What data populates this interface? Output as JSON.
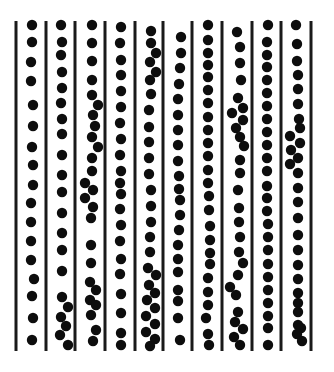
{
  "figure": {
    "colors": {
      "background": "#ffffff",
      "line": "#1a1a1a",
      "dot": "#0d0d0d"
    },
    "line_top": 21,
    "line_bottom": 351,
    "line_width": 3,
    "dot_radius": 5.2,
    "lines_x": [
      16,
      46,
      75,
      105,
      135,
      163,
      192,
      222,
      252,
      281,
      311
    ],
    "channels": [
      {
        "id": 1,
        "dots": [
          [
            32,
            25
          ],
          [
            32,
            42
          ],
          [
            31,
            62
          ],
          [
            31,
            81
          ],
          [
            33,
            105
          ],
          [
            33,
            126
          ],
          [
            32,
            147
          ],
          [
            33,
            165
          ],
          [
            33,
            185
          ],
          [
            31,
            203
          ],
          [
            31,
            222
          ],
          [
            31,
            241
          ],
          [
            31,
            260
          ],
          [
            34,
            279
          ],
          [
            32,
            296
          ],
          [
            33,
            318
          ],
          [
            32,
            340
          ]
        ]
      },
      {
        "id": 2,
        "dots": [
          [
            61,
            25
          ],
          [
            62,
            42
          ],
          [
            61,
            55
          ],
          [
            62,
            72
          ],
          [
            62,
            88
          ],
          [
            61,
            103
          ],
          [
            62,
            119
          ],
          [
            62,
            134
          ],
          [
            62,
            155
          ],
          [
            62,
            175
          ],
          [
            62,
            192
          ],
          [
            62,
            213
          ],
          [
            62,
            233
          ],
          [
            62,
            250
          ],
          [
            62,
            271
          ],
          [
            62,
            297
          ],
          [
            68,
            307
          ],
          [
            61,
            317
          ],
          [
            66,
            326
          ],
          [
            60,
            335
          ],
          [
            68,
            345
          ]
        ]
      },
      {
        "id": 3,
        "dots": [
          [
            92,
            25
          ],
          [
            92,
            43
          ],
          [
            92,
            61
          ],
          [
            92,
            80
          ],
          [
            92,
            95
          ],
          [
            98,
            105
          ],
          [
            93,
            115
          ],
          [
            95,
            126
          ],
          [
            92,
            137
          ],
          [
            98,
            147
          ],
          [
            92,
            158
          ],
          [
            92,
            171
          ],
          [
            85,
            183
          ],
          [
            93,
            190
          ],
          [
            85,
            198
          ],
          [
            93,
            207
          ],
          [
            91,
            218
          ],
          [
            91,
            245
          ],
          [
            91,
            263
          ],
          [
            90,
            282
          ],
          [
            96,
            290
          ],
          [
            90,
            300
          ],
          [
            96,
            305
          ],
          [
            91,
            315
          ],
          [
            96,
            330
          ],
          [
            93,
            341
          ]
        ]
      },
      {
        "id": 4,
        "dots": [
          [
            121,
            27
          ],
          [
            120,
            43
          ],
          [
            121,
            60
          ],
          [
            121,
            75
          ],
          [
            121,
            91
          ],
          [
            121,
            107
          ],
          [
            120,
            123
          ],
          [
            121,
            139
          ],
          [
            120,
            155
          ],
          [
            121,
            171
          ],
          [
            120,
            183
          ],
          [
            121,
            194
          ],
          [
            120,
            209
          ],
          [
            121,
            225
          ],
          [
            120,
            241
          ],
          [
            121,
            259
          ],
          [
            120,
            274
          ],
          [
            121,
            294
          ],
          [
            121,
            313
          ],
          [
            121,
            333
          ],
          [
            121,
            345
          ]
        ]
      },
      {
        "id": 5,
        "dots": [
          [
            151,
            31
          ],
          [
            151,
            43
          ],
          [
            156,
            53
          ],
          [
            150,
            62
          ],
          [
            156,
            72
          ],
          [
            150,
            80
          ],
          [
            151,
            94
          ],
          [
            149,
            110
          ],
          [
            149,
            127
          ],
          [
            149,
            142
          ],
          [
            149,
            158
          ],
          [
            149,
            174
          ],
          [
            151,
            190
          ],
          [
            151,
            206
          ],
          [
            151,
            222
          ],
          [
            150,
            237
          ],
          [
            150,
            252
          ],
          [
            148,
            268
          ],
          [
            156,
            275
          ],
          [
            149,
            285
          ],
          [
            155,
            293
          ],
          [
            147,
            300
          ],
          [
            155,
            308
          ],
          [
            146,
            316
          ],
          [
            155,
            324
          ],
          [
            146,
            332
          ],
          [
            155,
            339
          ],
          [
            150,
            346
          ]
        ]
      },
      {
        "id": 6,
        "dots": [
          [
            181,
            37
          ],
          [
            181,
            53
          ],
          [
            180,
            68
          ],
          [
            179,
            84
          ],
          [
            178,
            99
          ],
          [
            178,
            115
          ],
          [
            178,
            130
          ],
          [
            178,
            145
          ],
          [
            178,
            161
          ],
          [
            179,
            176
          ],
          [
            179,
            189
          ],
          [
            180,
            200
          ],
          [
            180,
            215
          ],
          [
            179,
            230
          ],
          [
            178,
            245
          ],
          [
            178,
            259
          ],
          [
            178,
            272
          ],
          [
            178,
            290
          ],
          [
            178,
            301
          ],
          [
            178,
            318
          ],
          [
            180,
            340
          ]
        ]
      },
      {
        "id": 7,
        "dots": [
          [
            208,
            25
          ],
          [
            208,
            40
          ],
          [
            208,
            53
          ],
          [
            208,
            65
          ],
          [
            208,
            77
          ],
          [
            208,
            90
          ],
          [
            208,
            103
          ],
          [
            208,
            117
          ],
          [
            208,
            130
          ],
          [
            208,
            143
          ],
          [
            208,
            156
          ],
          [
            208,
            170
          ],
          [
            208,
            183
          ],
          [
            209,
            196
          ],
          [
            209,
            210
          ],
          [
            210,
            226
          ],
          [
            210,
            240
          ],
          [
            210,
            253
          ],
          [
            210,
            264
          ],
          [
            208,
            278
          ],
          [
            208,
            292
          ],
          [
            208,
            305
          ],
          [
            206,
            318
          ],
          [
            208,
            334
          ],
          [
            209,
            345
          ]
        ]
      },
      {
        "id": 8,
        "dots": [
          [
            237,
            32
          ],
          [
            240,
            47
          ],
          [
            240,
            63
          ],
          [
            241,
            80
          ],
          [
            238,
            98
          ],
          [
            243,
            108
          ],
          [
            232,
            113
          ],
          [
            243,
            120
          ],
          [
            236,
            128
          ],
          [
            240,
            137
          ],
          [
            244,
            146
          ],
          [
            240,
            160
          ],
          [
            240,
            173
          ],
          [
            238,
            190
          ],
          [
            239,
            208
          ],
          [
            239,
            222
          ],
          [
            240,
            237
          ],
          [
            239,
            252
          ],
          [
            243,
            263
          ],
          [
            238,
            275
          ],
          [
            230,
            287
          ],
          [
            236,
            295
          ],
          [
            238,
            312
          ],
          [
            235,
            322
          ],
          [
            243,
            329
          ],
          [
            234,
            337
          ],
          [
            240,
            345
          ]
        ]
      },
      {
        "id": 9,
        "dots": [
          [
            268,
            25
          ],
          [
            267,
            42
          ],
          [
            267,
            55
          ],
          [
            267,
            67
          ],
          [
            267,
            80
          ],
          [
            267,
            93
          ],
          [
            267,
            106
          ],
          [
            267,
            119
          ],
          [
            267,
            132
          ],
          [
            267,
            145
          ],
          [
            267,
            158
          ],
          [
            267,
            171
          ],
          [
            267,
            186
          ],
          [
            267,
            198
          ],
          [
            267,
            211
          ],
          [
            268,
            224
          ],
          [
            268,
            237
          ],
          [
            268,
            250
          ],
          [
            268,
            264
          ],
          [
            268,
            277
          ],
          [
            268,
            290
          ],
          [
            268,
            303
          ],
          [
            268,
            316
          ],
          [
            268,
            328
          ],
          [
            268,
            345
          ]
        ]
      },
      {
        "id": 10,
        "dots": [
          [
            296,
            25
          ],
          [
            297,
            44
          ],
          [
            297,
            61
          ],
          [
            298,
            75
          ],
          [
            298,
            89
          ],
          [
            298,
            104
          ],
          [
            299,
            119
          ],
          [
            300,
            128
          ],
          [
            290,
            136
          ],
          [
            300,
            143
          ],
          [
            291,
            150
          ],
          [
            298,
            158
          ],
          [
            290,
            164
          ],
          [
            298,
            173
          ],
          [
            298,
            188
          ],
          [
            298,
            202
          ],
          [
            298,
            218
          ],
          [
            298,
            235
          ],
          [
            298,
            250
          ],
          [
            298,
            265
          ],
          [
            298,
            279
          ],
          [
            298,
            293
          ],
          [
            298,
            303
          ],
          [
            298,
            312
          ],
          [
            298,
            325
          ],
          [
            301,
            328
          ],
          [
            297,
            334
          ],
          [
            302,
            341
          ]
        ]
      }
    ]
  }
}
